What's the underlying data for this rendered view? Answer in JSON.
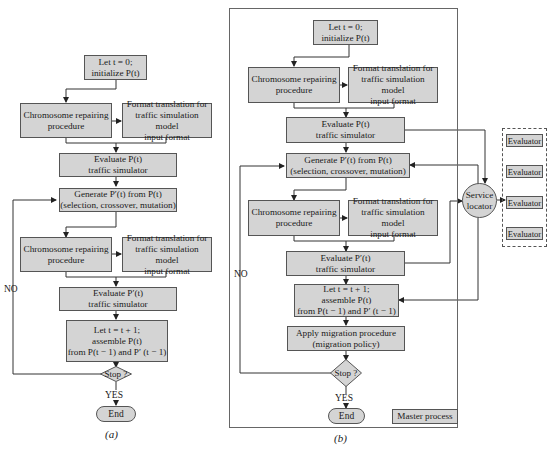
{
  "diagram_a": {
    "sublabel": "(a)",
    "nodes": {
      "init": "Let t = 0;\ninitialize P(t)",
      "repair1": "Chromosome repairing\nprocedure",
      "format1": "Format translation for\ntraffic simulation model\ninput format",
      "evaluate1": "Evaluate P(t)\ntraffic simulator",
      "generate": "Generate P′(t) from P(t)\n(selection, crossover, mutation)",
      "repair2": "Chromosome repairing\nprocedure",
      "format2": "Format translation for\ntraffic simulation model\ninput format",
      "evaluate2": "Evaluate P′(t)\ntraffic simulator",
      "assemble": "Let t = t + 1;\nassemble P(t)\nfrom P(t − 1) and P′ (t − 1)",
      "stop": "Stop ?",
      "end": "End"
    },
    "edge_labels": {
      "no": "NO",
      "yes": "YES"
    }
  },
  "diagram_b": {
    "sublabel": "(b)",
    "nodes": {
      "init": "Let t = 0;\ninitialize P(t)",
      "repair1": "Chromosome repairing\nprocedure",
      "format1": "Format translation for\ntraffic simulation model\ninput format",
      "evaluate1": "Evaluate P(t)\ntraffic simulator",
      "generate": "Generate P′(t) from P(t)\n(selection, crossover, mutation)",
      "repair2": "Chromosome repairing\nprocedure",
      "format2": "Format translation for\ntraffic simulation model\ninput format",
      "evaluate2": "Evaluate P′(t)\ntraffic simulator",
      "assemble": "Let t = t + 1;\nassemble P(t)\nfrom P(t − 1) and P′ (t − 1)",
      "migration": "Apply migration procedure\n(migration policy)",
      "stop": "Stop ?",
      "end": "End",
      "master": "Master process",
      "service_locator": "Service\nlocator",
      "evaluators": [
        "Evaluator",
        "Evaluator",
        "Evaluator",
        "Evaluator"
      ]
    },
    "edge_labels": {
      "no": "NO",
      "yes": "YES"
    }
  },
  "colors": {
    "box_fill": "#d4d4d4",
    "stroke": "#555555",
    "background": "#ffffff"
  }
}
